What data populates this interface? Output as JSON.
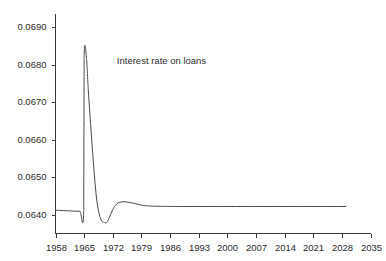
{
  "chart_data": {
    "type": "line",
    "title": "",
    "subtitle": "",
    "xlabel": "",
    "ylabel": "",
    "grid": false,
    "legend_position": "none",
    "annotations": [
      {
        "text": "Interest rate on loans",
        "x": 1973,
        "y": 0.0681
      }
    ],
    "xlim": [
      1958,
      2035
    ],
    "ylim": [
      0.0635,
      0.06935
    ],
    "xticks": [
      1958,
      1965,
      1972,
      1979,
      1986,
      1993,
      2000,
      2007,
      2014,
      2021,
      2028,
      2035
    ],
    "xtick_labels": [
      "1958",
      "1965",
      "1972",
      "1979",
      "1986",
      "1993",
      "2000",
      "2007",
      "2014",
      "2021",
      "2028",
      "2035"
    ],
    "yticks": [
      0.064,
      0.065,
      0.066,
      0.067,
      0.068,
      0.069
    ],
    "ytick_labels": [
      "0.0640",
      "0.0650",
      "0.0660",
      "0.0670",
      "0.0680",
      "0.0690"
    ],
    "series": [
      {
        "name": "Interest rate on loans",
        "color": "#4a4a4a",
        "x": [
          1958,
          1959,
          1960,
          1961,
          1962,
          1963,
          1964,
          1964.9,
          1965.0,
          1965.6,
          1966,
          1967,
          1968,
          1969,
          1970,
          1970.6,
          1971,
          1972,
          1973,
          1974,
          1975,
          1976,
          1977,
          1978,
          1979,
          1980,
          1982,
          1984,
          1986,
          1990,
          1994,
          1998,
          2002,
          2006,
          2010,
          2014,
          2018,
          2022,
          2026,
          2029
        ],
        "y": [
          0.06412,
          0.064115,
          0.06411,
          0.064105,
          0.0641,
          0.064095,
          0.064092,
          0.06409,
          0.06818,
          0.068175,
          0.06735,
          0.06578,
          0.06447,
          0.0639,
          0.06379,
          0.0638,
          0.06388,
          0.06414,
          0.06429,
          0.06434,
          0.064345,
          0.06433,
          0.06431,
          0.06428,
          0.064255,
          0.06424,
          0.064228,
          0.064224,
          0.064222,
          0.06422,
          0.06422,
          0.06422,
          0.06422,
          0.06422,
          0.06422,
          0.06422,
          0.06422,
          0.06422,
          0.06422,
          0.06422
        ]
      }
    ]
  }
}
